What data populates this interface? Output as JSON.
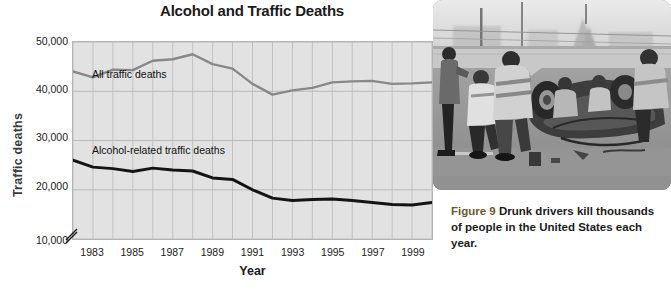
{
  "figure": {
    "title": "Alcohol and Traffic Deaths",
    "caption_number": "Figure 9",
    "caption_text": "Drunk drivers kill thousands of people in the United States each year.",
    "photo_alt": "overturned-car-crash-photo"
  },
  "chart_data": {
    "type": "line",
    "title": "Alcohol and Traffic Deaths",
    "xlabel": "Year",
    "ylabel": "Traffic deaths",
    "xlim": [
      1982,
      2000
    ],
    "ylim": [
      10000,
      50000
    ],
    "grid": true,
    "axis_break": true,
    "legend_position": "inline-labels",
    "ytick_labels": [
      "50,000",
      "40,000",
      "30,000",
      "20,000",
      "10,000"
    ],
    "ytick_values": [
      50000,
      40000,
      30000,
      20000,
      10000
    ],
    "xtick_labels": [
      "1983",
      "1985",
      "1987",
      "1989",
      "1991",
      "1993",
      "1995",
      "1997",
      "1999"
    ],
    "xtick_values": [
      1983,
      1985,
      1987,
      1989,
      1991,
      1993,
      1995,
      1997,
      1999
    ],
    "x": [
      1982,
      1983,
      1984,
      1985,
      1986,
      1987,
      1988,
      1989,
      1990,
      1991,
      1992,
      1993,
      1994,
      1995,
      1996,
      1997,
      1998,
      1999,
      2000
    ],
    "series": [
      {
        "name": "All traffic deaths",
        "color": "#888888",
        "values": [
          44000,
          42800,
          44400,
          44300,
          46200,
          46500,
          47500,
          45500,
          44600,
          41500,
          39300,
          40200,
          40700,
          41800,
          42000,
          42100,
          41500,
          41600,
          41800
        ]
      },
      {
        "name": "Alcohol-related traffic deaths",
        "color": "#141414",
        "values": [
          26000,
          24600,
          24300,
          23700,
          24400,
          24000,
          23800,
          22400,
          22100,
          20000,
          18300,
          17800,
          18000,
          18100,
          17800,
          17400,
          17000,
          16900,
          17400
        ]
      }
    ]
  }
}
